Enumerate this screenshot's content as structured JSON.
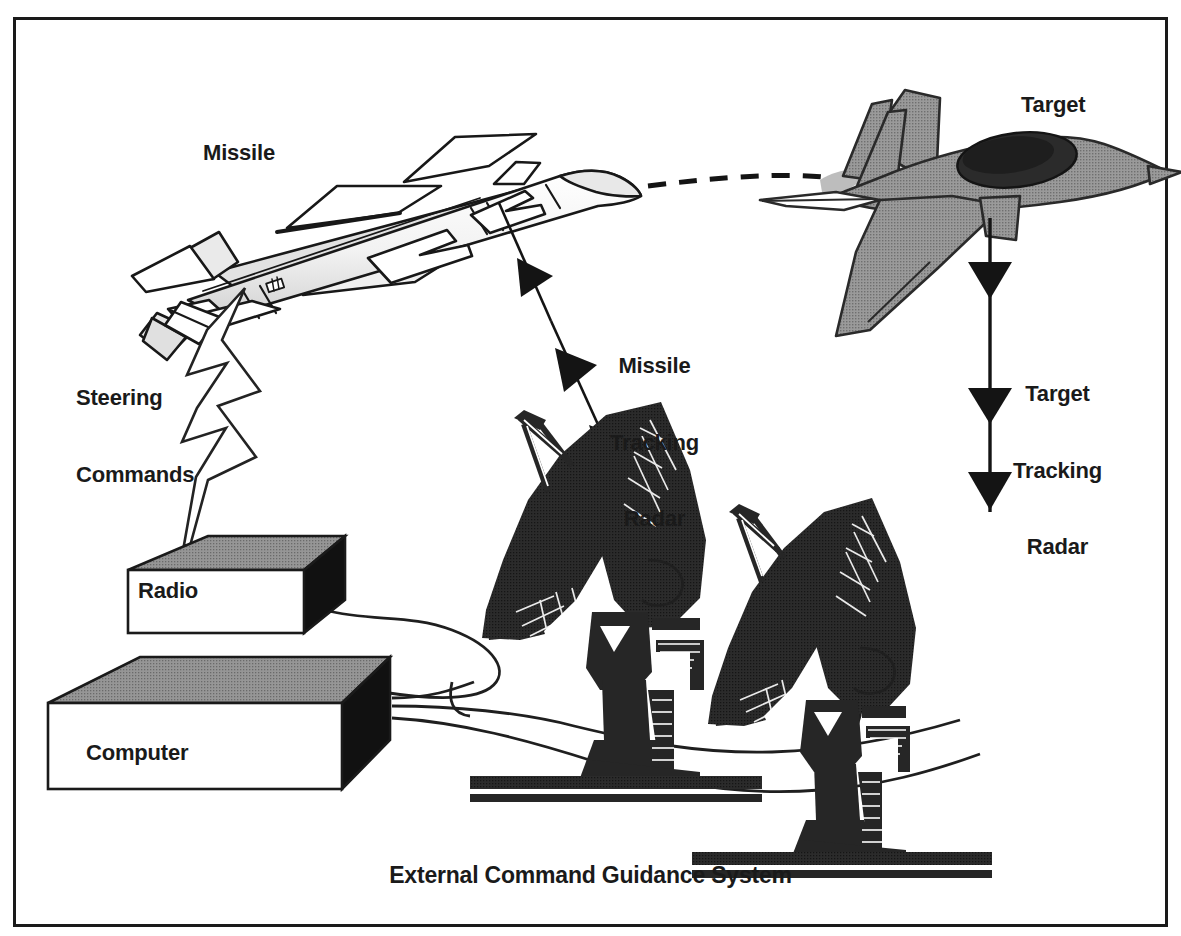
{
  "figure": {
    "caption": "External Command Guidance System",
    "frame": {
      "border_color": "#1a1a1a",
      "background": "#ffffff"
    }
  },
  "labels": {
    "missile": "Missile",
    "target": "Target",
    "steering_commands_line1": "Steering",
    "steering_commands_line2": "Commands",
    "missile_tracking_radar_line1": "Missile",
    "missile_tracking_radar_line2": "Tracking",
    "missile_tracking_radar_line3": "Radar",
    "target_tracking_radar_line1": "Target",
    "target_tracking_radar_line2": "Tracking",
    "target_tracking_radar_line3": "Radar",
    "radio": "Radio",
    "computer": "Computer"
  },
  "colors": {
    "ink": "#1a1a1a",
    "line": "#262626",
    "dish_dark": "#262626",
    "aircraft_gray": "#8a8a8a",
    "aircraft_gray_light": "#a8a8a8",
    "box_top_gray": "#8f8f8f",
    "box_side_black": "#111111",
    "box_face_white": "#ffffff",
    "missile_shade": "#d9d9d9",
    "white": "#ffffff"
  },
  "elements": {
    "missile_body": "missile-illustration",
    "target_aircraft": "fighter-jet-illustration",
    "missile_tracking_dish": "parabolic-antenna",
    "target_tracking_dish": "parabolic-antenna",
    "radio_unit": "equipment-box",
    "computer_unit": "equipment-box",
    "steering_command_link": "lightning-bolt-rf-link",
    "missile_flight_path": "dashed-trajectory-line",
    "missile_tracking_beam": "triple-arrowhead-beam",
    "target_tracking_beam": "triple-arrowhead-beam",
    "cables": "signal-cable-bundle"
  }
}
